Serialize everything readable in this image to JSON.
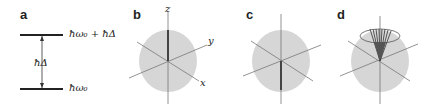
{
  "panels": [
    {
      "id": "a",
      "label": "a",
      "upper_level": "ħω₀ + ħΔ",
      "gap": "ħΔ",
      "lower_level": "ħω₀"
    },
    {
      "id": "b",
      "label": "b",
      "axes": {
        "z": "z",
        "y": "y",
        "x": "x"
      }
    },
    {
      "id": "c",
      "label": "c"
    },
    {
      "id": "d",
      "label": "d"
    }
  ],
  "colors": {
    "sphere": "#d6d6d6",
    "axis": "#666666",
    "vector": "#444444",
    "line": "#222222"
  }
}
